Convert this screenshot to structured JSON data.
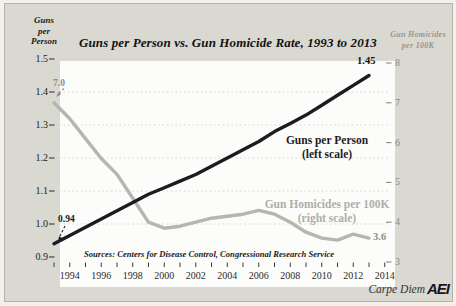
{
  "title": "Guns per Person vs. Gun Homicide Rate, 1993 to 2013",
  "left_axis": {
    "title_lines": [
      "Guns",
      "per",
      "Person"
    ],
    "tick_labels": [
      "0.9",
      "1.0",
      "1.1",
      "1.2",
      "1.3",
      "1.4",
      "1.5"
    ]
  },
  "right_axis": {
    "title_lines": [
      "Gun Homicides",
      "per 100K"
    ],
    "tick_labels": [
      "3",
      "4",
      "5",
      "6",
      "7",
      "8"
    ]
  },
  "x_axis": {
    "tick_labels": [
      "1994",
      "1996",
      "1998",
      "2000",
      "2002",
      "2004",
      "2006",
      "2008",
      "2010",
      "2012",
      "2014"
    ]
  },
  "labels": {
    "left_scale_note": "(left scale)",
    "right_scale_note": "(right scale)"
  },
  "sources": "Sources: Centers for Disease Control, Congressional Research Service",
  "footer": {
    "credit": "Carpe Diem",
    "logo": "AEI"
  },
  "colors": {
    "background": "#d9d8d1",
    "plot_background": "#fcfcfa",
    "guns_line": "#1b1b21",
    "homicides_line": "#b5b5b2",
    "muted_text": "#8e8e88",
    "dark_text": "#161616",
    "gridline": "#cfcfc8"
  },
  "chart_data": {
    "type": "line",
    "title": "Guns per Person vs. Gun Homicide Rate, 1993 to 2013",
    "x": [
      1993,
      1994,
      1995,
      1996,
      1997,
      1998,
      1999,
      2000,
      2001,
      2002,
      2003,
      2004,
      2005,
      2006,
      2007,
      2008,
      2009,
      2010,
      2011,
      2012,
      2013
    ],
    "series": [
      {
        "name": "Guns per Person",
        "scale": "left",
        "color": "#1b1b21",
        "values": [
          0.94,
          0.965,
          0.99,
          1.015,
          1.04,
          1.065,
          1.09,
          1.11,
          1.13,
          1.15,
          1.175,
          1.2,
          1.225,
          1.25,
          1.28,
          1.305,
          1.33,
          1.36,
          1.39,
          1.42,
          1.45
        ]
      },
      {
        "name": "Gun Homicides per 100K",
        "scale": "right",
        "color": "#b5b5b2",
        "values": [
          7.0,
          6.6,
          6.1,
          5.6,
          5.2,
          4.6,
          4.0,
          3.85,
          3.9,
          4.0,
          4.1,
          4.15,
          4.2,
          4.3,
          4.2,
          4.0,
          3.75,
          3.6,
          3.55,
          3.7,
          3.6
        ]
      }
    ],
    "left_ylim": [
      0.9,
      1.5
    ],
    "right_ylim": [
      3,
      8
    ],
    "xlim": [
      1993,
      2014
    ],
    "grid": "horizontal dotted lines at left-axis tick levels",
    "legend_position": "labels placed inside plot next to lines",
    "endpoint_labels": {
      "guns_start": "0.94",
      "guns_end": "1.45",
      "homicides_start": "7.0",
      "homicides_end": "3.6"
    }
  }
}
